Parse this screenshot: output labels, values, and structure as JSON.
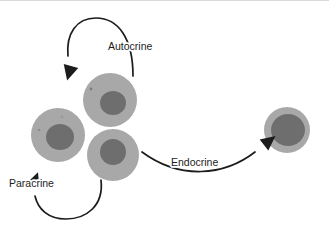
{
  "figure": {
    "background_color": "#ffffff",
    "width": 329,
    "height": 225
  },
  "labels": {
    "autocrine": "Autocrine",
    "paracrine": "Paracrine",
    "endocrine": "Endocrine"
  },
  "colors": {
    "cytoplasm": "#a8a8a8",
    "nucleus": "#6e6e6e",
    "stroke": "#1c1c1c",
    "text": "#1c1c1c",
    "top_edge": "#d9d9d9"
  },
  "cells": [
    {
      "id": "signalling-cell-top",
      "name": "top-cell",
      "cx": 110,
      "cy": 100,
      "r": 27,
      "nucleus_cx": 113,
      "nucleus_cy": 103,
      "nucleus_rx": 13,
      "nucleus_ry": 12
    },
    {
      "id": "signalling-cell-left",
      "name": "left-cell",
      "cx": 58,
      "cy": 135,
      "r": 27,
      "nucleus_cx": 60,
      "nucleus_cy": 137,
      "nucleus_rx": 14,
      "nucleus_ry": 13
    },
    {
      "id": "signalling-cell-bottom",
      "name": "bottom-cell",
      "cx": 113,
      "cy": 155,
      "r": 26,
      "nucleus_cx": 113,
      "nucleus_cy": 152,
      "nucleus_rx": 13,
      "nucleus_ry": 13
    },
    {
      "id": "target-cell-right",
      "name": "distant-target-cell",
      "cx": 287,
      "cy": 130,
      "r": 23,
      "nucleus_cx": 288,
      "nucleus_cy": 130,
      "nucleus_rx": 17,
      "nucleus_ry": 16
    }
  ],
  "arrows": [
    {
      "id": "autocrine-arrow",
      "label": "Autocrine",
      "description": "loops from the top cell up and back down onto itself",
      "path": "M 133 76 C 133 38 118 18 96 18 C 76 18 66 34 68 56",
      "head_at": [
        71,
        66
      ],
      "head_rotation": 105
    },
    {
      "id": "paracrine-arrow",
      "label": "Paracrine",
      "description": "loops from the bottom cell down and around to the adjacent left cell",
      "path": "M 101 180 C 104 206 86 219 66 219 C 48 219 38 209 35 196",
      "head_at": [
        33,
        186
      ],
      "head_rotation": -70
    },
    {
      "id": "endocrine-arrow",
      "label": "Endocrine",
      "description": "travels a long distance from the bottom cell to the distant target cell",
      "path": "M 142 152 C 180 180 224 176 255 152",
      "head_at": [
        264,
        145
      ],
      "head_rotation": -38
    }
  ]
}
